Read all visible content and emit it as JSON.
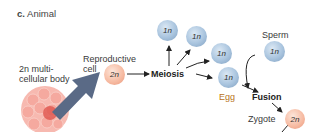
{
  "title": {
    "letter": "c.",
    "text": "Animal"
  },
  "labels": {
    "body": [
      "2n multi-",
      "cellular body"
    ],
    "reproductive": [
      "Reproductive",
      "cell"
    ],
    "meiosis": "Meiosis",
    "sperm": "Sperm",
    "egg": "Egg",
    "fusion": "Fusion",
    "zygote": "Zygote"
  },
  "cells": {
    "reproductive": "2n",
    "haploid1": "1n",
    "haploid2": "1n",
    "haploid3": "1n",
    "egg": "1n",
    "sperm": "1n",
    "zygote": "2n"
  },
  "colors": {
    "haploid": "#a9c4de",
    "diploid": "#f6b9a0",
    "arrow": "#5a6a86",
    "egg_label": "#b8741a"
  }
}
